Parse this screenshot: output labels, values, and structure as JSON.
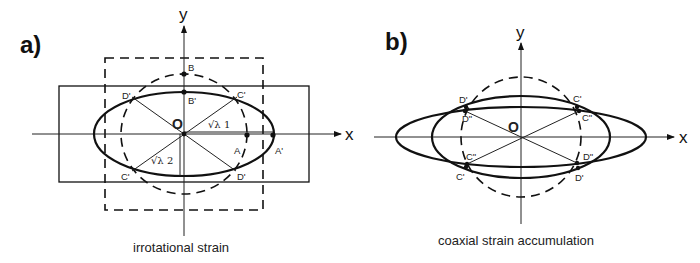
{
  "panels": {
    "a": {
      "label": "a)",
      "caption": "irrotational strain",
      "axes": {
        "x": "x",
        "y": "y"
      },
      "origin": "O",
      "points": {
        "B": "B",
        "B_prime": "B'",
        "A": "A",
        "A_prime": "A'",
        "C_prime_upper": "C'",
        "D_prime_upper": "D'",
        "C_prime_lower": "C'",
        "D_prime_lower": "D'"
      },
      "sqrt_lambda1": "√λ 1",
      "sqrt_lambda2": "√λ 2",
      "shapes": [
        "dashed unit circle",
        "solid strain ellipse",
        "dashed square (original)",
        "solid rectangle (deformed)"
      ]
    },
    "b": {
      "label": "b)",
      "caption": "coaxial strain accumulation",
      "axes": {
        "x": "x",
        "y": "y"
      },
      "origin": "O",
      "points": {
        "D_prime_upper": "D'",
        "D_dprime_upper": "D\"",
        "C_prime_upper": "C'",
        "C_dprime_upper": "C\"",
        "C_dprime_lower": "C\"",
        "C_prime_lower": "C'",
        "D_dprime_lower": "D\"",
        "D_prime_lower": "D'"
      },
      "shapes": [
        "dashed unit circle",
        "first strain ellipse",
        "second (accumulated) strain ellipse"
      ]
    }
  }
}
